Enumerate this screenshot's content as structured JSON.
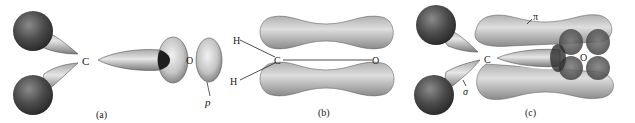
{
  "figure": {
    "panels": [
      {
        "id": "a",
        "caption": "(a)",
        "atom_labels": {
          "carbon": "C",
          "oxygen": "O"
        },
        "orbital_labels": {
          "p": "p"
        }
      },
      {
        "id": "b",
        "caption": "(b)",
        "atom_labels": {
          "h_top": "H",
          "h_bottom": "H",
          "carbon": "C",
          "oxygen": "O"
        }
      },
      {
        "id": "c",
        "caption": "(c)",
        "atom_labels": {
          "carbon": "C",
          "oxygen": "O"
        },
        "bond_labels": {
          "pi": "π",
          "sigma": "σ"
        }
      }
    ],
    "colors": {
      "background": "#ffffff",
      "sphere_dark": "#3a3a3a",
      "lobe_light": "#d8d8d8",
      "lobe_mid": "#9a9a9a",
      "text": "#1a1a1a"
    }
  }
}
